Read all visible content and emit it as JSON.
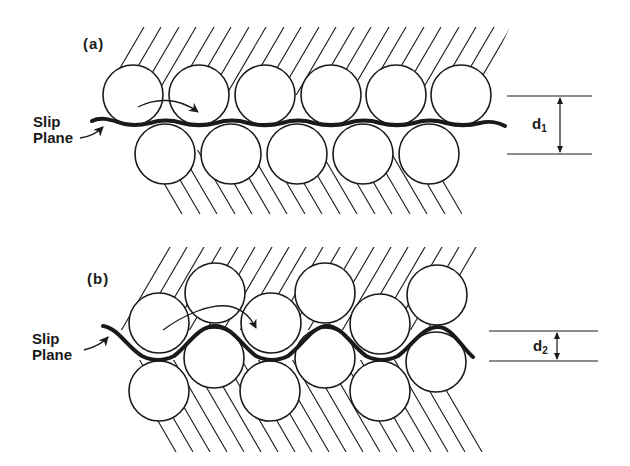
{
  "figure": {
    "panels": [
      {
        "id": "a",
        "label": "(a)",
        "slip_label_line1": "Slip",
        "slip_label_line2": "Plane",
        "spacing_symbol": "d",
        "spacing_subscript": "1",
        "arrangement": "close-packed rows, slip plane flat (wide spacing)"
      },
      {
        "id": "b",
        "label": "(b)",
        "slip_label_line1": "Slip",
        "slip_label_line2": "Plane",
        "spacing_symbol": "d",
        "spacing_subscript": "2",
        "arrangement": "non-close-packed rows, slip plane wavy (narrow spacing)"
      }
    ],
    "colors": {
      "ink": "#1a1a1a",
      "background": "#ffffff"
    }
  }
}
